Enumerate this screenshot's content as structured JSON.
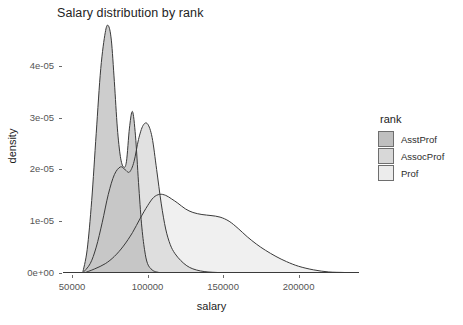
{
  "chart_data": {
    "type": "area",
    "title": "Salary distribution by rank",
    "xlabel": "salary",
    "ylabel": "density",
    "xlim": [
      44000,
      240000
    ],
    "ylim": [
      0,
      4.85e-05
    ],
    "grid": false,
    "legend_position": "right",
    "legend_title": "rank",
    "x_ticks": [
      {
        "value": 50000,
        "label": "50000"
      },
      {
        "value": 100000,
        "label": "100000"
      },
      {
        "value": 150000,
        "label": "150000"
      },
      {
        "value": 200000,
        "label": "200000"
      }
    ],
    "y_ticks": [
      {
        "value": 0.0,
        "label": "0e+00"
      },
      {
        "value": 1e-05,
        "label": "1e-05"
      },
      {
        "value": 2e-05,
        "label": "2e-05"
      },
      {
        "value": 3e-05,
        "label": "3e-05"
      },
      {
        "value": 4e-05,
        "label": "4e-05"
      }
    ],
    "series": [
      {
        "name": "AsstProf",
        "fill": "#bfbfbf",
        "stroke": "#3a3a3a",
        "x": [
          57000,
          60000,
          63000,
          66000,
          69000,
          72000,
          74000,
          76000,
          78000,
          80000,
          82000,
          84000,
          86000,
          88000,
          90000,
          92000,
          94000,
          96000,
          98000,
          100000,
          103000,
          106000,
          110000,
          115000
        ],
        "y": [
          0.0,
          4.5e-06,
          1.4e-05,
          2.7e-05,
          3.95e-05,
          4.65e-05,
          4.78e-05,
          4.5e-05,
          3.7e-05,
          2.8e-05,
          2.25e-05,
          2.05e-05,
          2.15e-05,
          2.8e-05,
          3.12e-05,
          2.65e-05,
          1.75e-05,
          9.5e-06,
          4.5e-06,
          1.8e-06,
          6e-07,
          2e-07,
          0.0,
          0.0
        ]
      },
      {
        "name": "AssocProf",
        "fill": "#d8d8d8",
        "stroke": "#3a3a3a",
        "x": [
          57000,
          62000,
          66000,
          70000,
          74000,
          78000,
          82000,
          85000,
          88000,
          91000,
          94000,
          97000,
          100000,
          103000,
          106000,
          109000,
          112000,
          115000,
          118000,
          122000,
          126000,
          130000,
          135000,
          140000,
          146000,
          152000
        ],
        "y": [
          0.0,
          1.8e-06,
          5e-06,
          9.8e-06,
          1.52e-05,
          1.9e-05,
          2.05e-05,
          2e-05,
          1.95e-05,
          2.15e-05,
          2.58e-05,
          2.85e-05,
          2.88e-05,
          2.62e-05,
          2e-05,
          1.35e-05,
          8.5e-06,
          5.5e-06,
          3.8e-06,
          2.4e-06,
          1.4e-06,
          8e-07,
          4e-07,
          2e-07,
          1e-07,
          0.0
        ]
      },
      {
        "name": "Prof",
        "fill": "#ececec",
        "stroke": "#3a3a3a",
        "x": [
          58000,
          65000,
          72000,
          78000,
          84000,
          90000,
          95000,
          100000,
          104000,
          108000,
          112000,
          116000,
          120000,
          125000,
          130000,
          136000,
          142000,
          148000,
          154000,
          160000,
          166000,
          172000,
          178000,
          185000,
          192000,
          200000,
          210000,
          220000,
          230000,
          238000
        ],
        "y": [
          0.0,
          8e-07,
          1.8e-06,
          3.2e-06,
          5.2e-06,
          7.8e-06,
          1.05e-05,
          1.3e-05,
          1.46e-05,
          1.52e-05,
          1.5e-05,
          1.43e-05,
          1.35e-05,
          1.24e-05,
          1.17e-05,
          1.13e-05,
          1.11e-05,
          1.08e-05,
          1e-05,
          8.6e-06,
          7e-06,
          5.6e-06,
          4.4e-06,
          3.2e-06,
          2.2e-06,
          1.3e-06,
          6e-07,
          2e-07,
          1e-07,
          0.0
        ]
      }
    ]
  },
  "legend": {
    "title": "rank",
    "items": [
      {
        "label": "AsstProf",
        "color": "#bfbfbf"
      },
      {
        "label": "AssocProf",
        "color": "#d8d8d8"
      },
      {
        "label": "Prof",
        "color": "#ececec"
      }
    ]
  },
  "panel": {
    "background": "#ffffff",
    "axis_color": "#6b6b6b"
  }
}
